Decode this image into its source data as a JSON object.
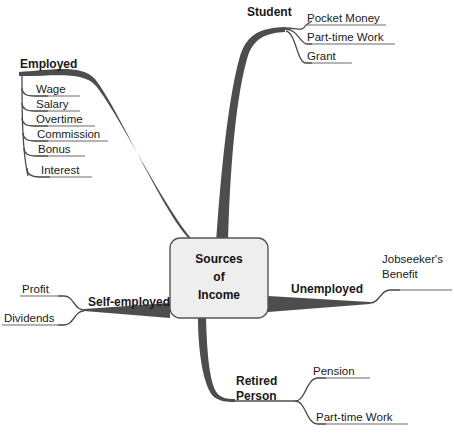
{
  "diagram": {
    "type": "mind-map",
    "title": "Sources of Income",
    "center": {
      "line1": "Sources",
      "line2": "of",
      "line3": "Income"
    },
    "colors": {
      "branch": "#4d4d4d",
      "underline": "#6b6b6b",
      "box_fill": "#eeeeee",
      "box_border": "#555555",
      "text": "#1a1a1a",
      "background": "#ffffff"
    },
    "branches": [
      {
        "id": "employed",
        "label": "Employed",
        "children": [
          {
            "label": "Wage"
          },
          {
            "label": "Salary"
          },
          {
            "label": "Overtime"
          },
          {
            "label": "Commission"
          },
          {
            "label": "Bonus"
          },
          {
            "label": "Interest"
          }
        ]
      },
      {
        "id": "student",
        "label": "Student",
        "children": [
          {
            "label": "Pocket Money"
          },
          {
            "label": "Part-time Work"
          },
          {
            "label": "Grant"
          }
        ]
      },
      {
        "id": "unemployed",
        "label": "Unemployed",
        "children": [
          {
            "label_line1": "Jobseeker's",
            "label_line2": "Benefit"
          }
        ]
      },
      {
        "id": "retired-person",
        "label_line1": "Retired",
        "label_line2": "Person",
        "children": [
          {
            "label": "Pension"
          },
          {
            "label": "Part-time Work"
          }
        ]
      },
      {
        "id": "self-employed",
        "label": "Self-employed",
        "children": [
          {
            "label": "Profit"
          },
          {
            "label": "Dividends"
          }
        ]
      }
    ]
  }
}
